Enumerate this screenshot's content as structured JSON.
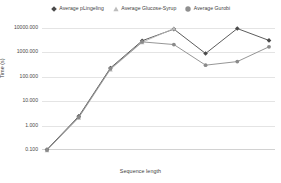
{
  "chart_data": {
    "type": "line",
    "title": "",
    "xlabel": "Sequence length",
    "ylabel": "Time (s)",
    "yscale": "log",
    "ylim": [
      0.1,
      10000
    ],
    "yticks": [
      0.1,
      1,
      10,
      100,
      1000,
      10000
    ],
    "ytick_labels": [
      "0.100",
      "1.000",
      "10.000",
      "100.000",
      "1000.000",
      "10000.000"
    ],
    "xtick_labels": [],
    "grid": true,
    "legend_position": "top",
    "x": [
      1,
      2,
      3,
      4,
      5,
      6,
      7,
      8
    ],
    "series": [
      {
        "name": "Average pLingeling",
        "marker": "diamond",
        "color": "#4a4a4a",
        "values": [
          0.105,
          2.4,
          230,
          3000,
          9000,
          900,
          9500,
          3100
        ]
      },
      {
        "name": "Average Glucose-Syrup",
        "marker": "triangle",
        "color": "#b9b9b9",
        "values": [
          0.098,
          2.1,
          200,
          2600,
          9500,
          null,
          null,
          null
        ]
      },
      {
        "name": "Average Gurobi",
        "marker": "circle",
        "color": "#8a8a8a",
        "values": [
          0.1,
          2.2,
          215,
          2700,
          2100,
          300,
          420,
          1700
        ]
      }
    ]
  },
  "legend": {
    "items": [
      {
        "label": "Average pLingeling",
        "marker": "diamond-marker-icon"
      },
      {
        "label": "Average Glucose-Syrup",
        "marker": "triangle-marker-icon"
      },
      {
        "label": "Average Gurobi",
        "marker": "circle-marker-icon"
      }
    ]
  },
  "axes": {
    "y_title": "Time (s)",
    "x_title": "Sequence length",
    "y_tick_labels": [
      "10000.000",
      "1000.000",
      "100.000",
      "10.000",
      "1.000",
      "0.100"
    ]
  }
}
